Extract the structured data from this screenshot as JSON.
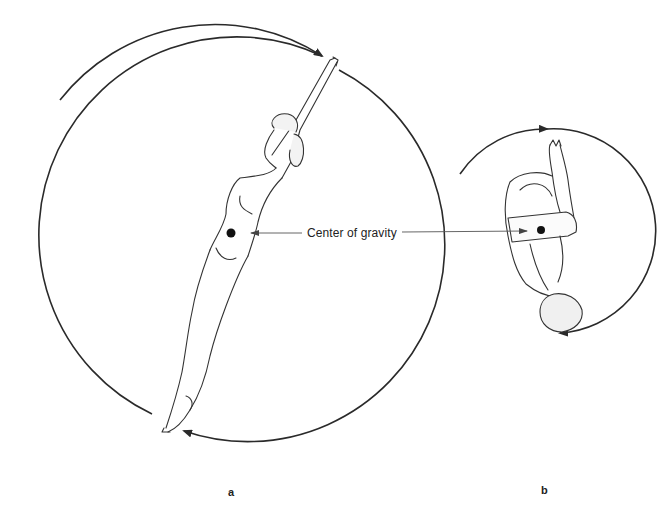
{
  "figure": {
    "annotation": "Center of gravity",
    "panels": [
      {
        "label": "a",
        "pose": "layout (extended body)",
        "rotation_circle": "large"
      },
      {
        "label": "b",
        "pose": "tuck (compact body)",
        "rotation_circle": "small"
      }
    ],
    "colors": {
      "line": "#2a2a2a",
      "pointer": "#555555",
      "background": "#ffffff"
    }
  }
}
